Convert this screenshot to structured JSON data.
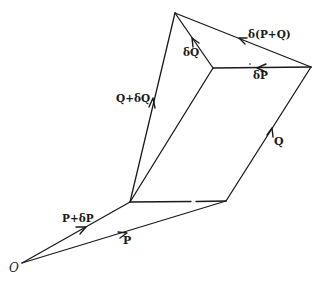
{
  "diagram": {
    "type": "vector-diagram",
    "stroke_color": "#1a1a1a",
    "background": "#ffffff",
    "points": {
      "O": [
        22,
        263
      ],
      "A": [
        130,
        202
      ],
      "B": [
        226,
        201
      ],
      "C": [
        311,
        67
      ],
      "D": [
        175,
        13
      ],
      "E": [
        213,
        68
      ]
    },
    "labels": {
      "origin": "O",
      "p": "P",
      "p_plus_dp": "P+δP",
      "q": "Q",
      "q_plus_dq": "Q+δQ",
      "dq": "δQ",
      "dp": "δP",
      "d_p_plus_q": "δ(P+Q)"
    },
    "vectors": [
      {
        "name": "P",
        "from": "O",
        "to": "B"
      },
      {
        "name": "P+δP",
        "from": "O",
        "to": "A"
      },
      {
        "name": "Q",
        "from": "B",
        "to": "C"
      },
      {
        "name": "Q+δQ",
        "from": "A",
        "to": "D"
      },
      {
        "name": "δQ",
        "from": "E",
        "to": "D"
      },
      {
        "name": "δP",
        "from": "C",
        "to": "E"
      },
      {
        "name": "δ(P+Q)",
        "from": "C",
        "to": "D"
      }
    ],
    "segments": [
      {
        "from": "A",
        "to": "E",
        "style": "solid"
      },
      {
        "from": "A",
        "to": "B",
        "style": "broken"
      }
    ]
  }
}
